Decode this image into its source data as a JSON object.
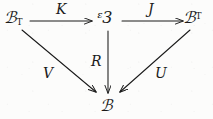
{
  "diagram": {
    "kind": "commutative-diagram",
    "background_color": "#fcfcfb",
    "ink_color": "#1a1a1a",
    "objects": [
      {
        "id": "ct",
        "base": "ℬ",
        "script_base": "C",
        "subscript": "T",
        "superscript": "",
        "display": "ℭT",
        "position": "top-left"
      },
      {
        "id": "x",
        "base": "ᵋ3",
        "script_base": "X",
        "subscript": "",
        "superscript": "",
        "display": "ᵋ3",
        "position": "top-center"
      },
      {
        "id": "cs",
        "base": "ℬ",
        "script_base": "C",
        "subscript": "",
        "superscript": "T",
        "display": "ℭT",
        "position": "top-right"
      },
      {
        "id": "c",
        "base": "ℬ",
        "script_base": "C",
        "subscript": "",
        "superscript": "",
        "display": "ℭ",
        "position": "bottom-center"
      }
    ],
    "arrows": [
      {
        "id": "k",
        "label": "K",
        "from": "ct",
        "to": "x",
        "style": "straight-horizontal"
      },
      {
        "id": "j",
        "label": "J",
        "from": "x",
        "to": "cs",
        "style": "straight-horizontal"
      },
      {
        "id": "r",
        "label": "R",
        "from": "x",
        "to": "c",
        "style": "straight-vertical"
      },
      {
        "id": "v",
        "label": "V",
        "from": "ct",
        "to": "c",
        "style": "straight-diagonal"
      },
      {
        "id": "u",
        "label": "U",
        "from": "cs",
        "to": "c",
        "style": "straight-diagonal"
      }
    ]
  }
}
